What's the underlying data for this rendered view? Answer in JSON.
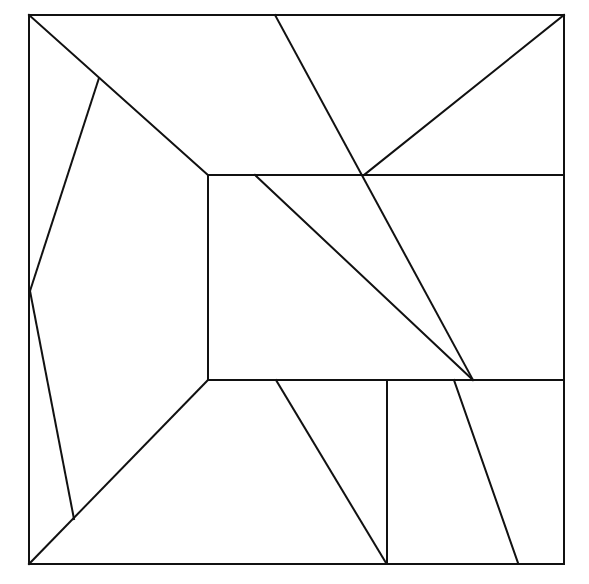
{
  "diagram": {
    "type": "geometric-dissection",
    "stroke_color": "#111111",
    "background_color": "#ffffff",
    "stroke_width": 2,
    "outer_square": {
      "x1": 29,
      "y1": 15,
      "x2": 564,
      "y2": 564
    },
    "inner_rectangle": {
      "x1": 208,
      "y1": 175,
      "x2": 564,
      "y2": 380
    },
    "segments": [
      {
        "name": "diag-top-left",
        "x1": 29,
        "y1": 15,
        "x2": 208,
        "y2": 175
      },
      {
        "name": "diag-bottom-left",
        "x1": 29,
        "y1": 564,
        "x2": 208,
        "y2": 380
      },
      {
        "name": "left-kite-upper",
        "x1": 99,
        "y1": 78,
        "x2": 30,
        "y2": 291
      },
      {
        "name": "left-kite-lower",
        "x1": 30,
        "y1": 291,
        "x2": 74,
        "y2": 519
      },
      {
        "name": "long-slant",
        "x1": 275,
        "y1": 15,
        "x2": 473,
        "y2": 380
      },
      {
        "name": "top-right-diag",
        "x1": 564,
        "y1": 15,
        "x2": 364,
        "y2": 175
      },
      {
        "name": "inner-diag",
        "x1": 255,
        "y1": 175,
        "x2": 473,
        "y2": 380
      },
      {
        "name": "bottom-slant-left",
        "x1": 276,
        "y1": 380,
        "x2": 386,
        "y2": 563
      },
      {
        "name": "bottom-vertical",
        "x1": 387,
        "y1": 380,
        "x2": 387,
        "y2": 563
      },
      {
        "name": "bottom-slant-right",
        "x1": 454,
        "y1": 380,
        "x2": 518,
        "y2": 563
      }
    ]
  }
}
